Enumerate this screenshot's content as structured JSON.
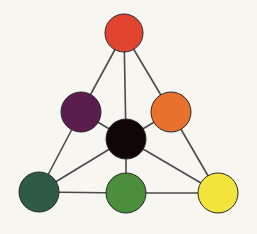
{
  "diagram": {
    "background": "#f7f6f0",
    "edge_color": "#4a4a4a",
    "node_stroke": "#2a2a2a",
    "nodes": [
      {
        "id": "top-red",
        "color": "#e2452f",
        "cx": 124,
        "cy": 33,
        "r": 19
      },
      {
        "id": "purple",
        "color": "#5b1d4e",
        "cx": 81,
        "cy": 112,
        "r": 20
      },
      {
        "id": "orange",
        "color": "#e8712e",
        "cx": 171,
        "cy": 112,
        "r": 20
      },
      {
        "id": "black",
        "color": "#120508",
        "cx": 126,
        "cy": 139,
        "r": 20
      },
      {
        "id": "dark-green",
        "color": "#2f5a45",
        "cx": 39,
        "cy": 192,
        "r": 20
      },
      {
        "id": "green",
        "color": "#4b8e3c",
        "cx": 126,
        "cy": 193,
        "r": 20
      },
      {
        "id": "yellow",
        "color": "#f2e43a",
        "cx": 218,
        "cy": 193,
        "r": 20
      }
    ],
    "edges": [
      [
        "top-red",
        "purple"
      ],
      [
        "top-red",
        "orange"
      ],
      [
        "top-red",
        "black"
      ],
      [
        "purple",
        "dark-green"
      ],
      [
        "purple",
        "black"
      ],
      [
        "orange",
        "black"
      ],
      [
        "orange",
        "yellow"
      ],
      [
        "black",
        "dark-green"
      ],
      [
        "black",
        "green"
      ],
      [
        "black",
        "yellow"
      ],
      [
        "dark-green",
        "green"
      ],
      [
        "green",
        "yellow"
      ]
    ]
  }
}
